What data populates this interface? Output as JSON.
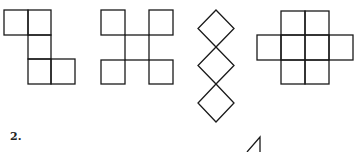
{
  "problem_label": "2.",
  "figures": [
    {
      "name": "net-figure-1",
      "description": "five-square net, staircase shape"
    },
    {
      "name": "net-figure-2",
      "description": "five-square net, X shape with diagonal corners"
    },
    {
      "name": "net-figure-3",
      "description": "three rotated squares stacked vertically"
    },
    {
      "name": "net-figure-4",
      "description": "eight-square cross shape"
    }
  ],
  "colors": {
    "stroke": "#1a1a1a",
    "background": "#ffffff"
  }
}
